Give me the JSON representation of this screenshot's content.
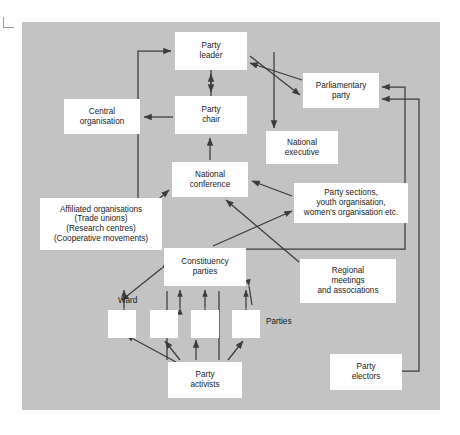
{
  "diagram": {
    "panel_color": "#c3c3c3",
    "box_color": "#ffffff",
    "line_color": "#3c3c3c",
    "nodes": [
      {
        "id": "party-leader",
        "label": "Party\nleader",
        "x": 175,
        "y": 32,
        "w": 72,
        "h": 38
      },
      {
        "id": "parliamentary-party",
        "label": "Parliamentary\nparty",
        "x": 303,
        "y": 73,
        "w": 76,
        "h": 35
      },
      {
        "id": "central-organisation",
        "label": "Central\norganisation",
        "x": 64,
        "y": 99,
        "w": 76,
        "h": 35
      },
      {
        "id": "party-chair",
        "label": "Party\nchair",
        "x": 175,
        "y": 96,
        "w": 72,
        "h": 38
      },
      {
        "id": "national-executive",
        "label": "National\nexecutive",
        "x": 266,
        "y": 131,
        "w": 72,
        "h": 33
      },
      {
        "id": "national-conference",
        "label": "National\nconference",
        "x": 172,
        "y": 162,
        "w": 76,
        "h": 35
      },
      {
        "id": "affiliated-organisations",
        "label": "Affiliated organisations\n(Trade unions)\n(Research centres)\n(Cooperative movements)",
        "x": 40,
        "y": 198,
        "w": 122,
        "h": 52
      },
      {
        "id": "party-sections",
        "label": "Party sections,\nyouth organisation,\nwomen's organisation etc.",
        "x": 294,
        "y": 183,
        "w": 114,
        "h": 40
      },
      {
        "id": "regional-meetings",
        "label": "Regional\nmeetings\nand associations",
        "x": 300,
        "y": 259,
        "w": 96,
        "h": 44
      },
      {
        "id": "constituency-parties",
        "label": "Constituency\nparties",
        "x": 164,
        "y": 248,
        "w": 82,
        "h": 38
      },
      {
        "id": "ward-box-1",
        "label": "",
        "x": 108,
        "y": 310,
        "w": 28,
        "h": 28
      },
      {
        "id": "ward-box-2",
        "label": "",
        "x": 150,
        "y": 310,
        "w": 28,
        "h": 28
      },
      {
        "id": "ward-box-3",
        "label": "",
        "x": 191,
        "y": 310,
        "w": 28,
        "h": 28
      },
      {
        "id": "ward-box-4",
        "label": "",
        "x": 232,
        "y": 310,
        "w": 28,
        "h": 28
      },
      {
        "id": "party-activists",
        "label": "Party\nactivists",
        "x": 168,
        "y": 362,
        "w": 74,
        "h": 36
      },
      {
        "id": "party-electors",
        "label": "Party\nelectors",
        "x": 330,
        "y": 354,
        "w": 72,
        "h": 36
      }
    ],
    "free_labels": [
      {
        "id": "ward-label",
        "text": "Ward",
        "x": 118,
        "y": 296
      },
      {
        "id": "parties-label",
        "text": "Parties",
        "x": 266,
        "y": 317
      }
    ],
    "connections": [
      {
        "from": "party-chair",
        "to": "party-leader",
        "type": "single"
      },
      {
        "from": "party-leader",
        "to": "parliamentary-party",
        "type": "double"
      },
      {
        "from": "party-chair",
        "to": "central-organisation",
        "type": "single"
      },
      {
        "from": "party-leader",
        "to": "national-executive",
        "type": "single"
      },
      {
        "from": "national-conference",
        "to": "party-chair",
        "type": "single"
      },
      {
        "from": "affiliated-organisations",
        "to": "party-leader",
        "type": "single"
      },
      {
        "from": "affiliated-organisations",
        "to": "national-conference",
        "type": "single"
      },
      {
        "from": "party-sections",
        "to": "national-conference",
        "type": "single"
      },
      {
        "from": "regional-meetings",
        "to": "national-conference",
        "type": "single"
      },
      {
        "from": "constituency-parties",
        "to": "party-sections",
        "type": "single"
      },
      {
        "from": "constituency-parties",
        "to": "parliamentary-party",
        "type": "single"
      },
      {
        "from": "party-electors",
        "to": "parliamentary-party",
        "type": "single"
      },
      {
        "from": "constituency-parties",
        "to": "ward-box-1",
        "type": "double"
      },
      {
        "from": "constituency-parties",
        "to": "ward-box-2",
        "type": "double"
      },
      {
        "from": "constituency-parties",
        "to": "ward-box-3",
        "type": "double"
      },
      {
        "from": "constituency-parties",
        "to": "ward-box-4",
        "type": "double"
      },
      {
        "from": "party-activists",
        "to": "ward-box-1",
        "type": "single"
      },
      {
        "from": "party-activists",
        "to": "ward-box-2",
        "type": "single"
      },
      {
        "from": "party-activists",
        "to": "ward-box-3",
        "type": "single"
      },
      {
        "from": "party-activists",
        "to": "ward-box-4",
        "type": "single"
      }
    ]
  }
}
